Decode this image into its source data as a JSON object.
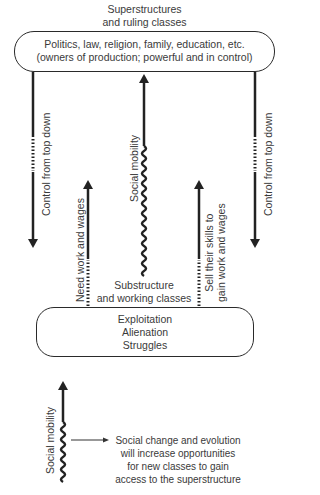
{
  "top": {
    "heading_line1": "Superstructures",
    "heading_line2": "and ruling classes",
    "box_line1": "Politics, law, religion, family, education, etc.",
    "box_line2": "(owners of production; powerful and in control)"
  },
  "arrows": {
    "left_control": "Control from top down",
    "right_control": "Control from top down",
    "center_mobility": "Social mobility",
    "need_work": "Need work and wages",
    "sell_skills_line1": "Sell their skills to",
    "sell_skills_line2": "gain work and wages"
  },
  "bottom": {
    "heading_line1": "Substructure",
    "heading_line2": "and working classes",
    "box_line1": "Exploitation",
    "box_line2": "Alienation",
    "box_line3": "Struggles"
  },
  "legend": {
    "mobility_label": "Social mobility",
    "text_line1": "Social change and evolution",
    "text_line2": "will increase opportunities",
    "text_line3": "for new classes to gain",
    "text_line4": "access to the superstructure"
  }
}
